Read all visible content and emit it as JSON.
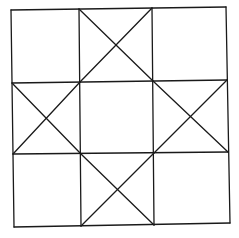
{
  "diagram": {
    "type": "quilt-block-grid",
    "rows": 3,
    "cols": 3,
    "line_color": "#1a1a1a",
    "background": "#ffffff",
    "cells": [
      {
        "row": 0,
        "col": 0,
        "crossed": false
      },
      {
        "row": 0,
        "col": 1,
        "crossed": true
      },
      {
        "row": 0,
        "col": 2,
        "crossed": false
      },
      {
        "row": 1,
        "col": 0,
        "crossed": true
      },
      {
        "row": 1,
        "col": 1,
        "crossed": false
      },
      {
        "row": 1,
        "col": 2,
        "crossed": true
      },
      {
        "row": 2,
        "col": 0,
        "crossed": false
      },
      {
        "row": 2,
        "col": 1,
        "crossed": true
      },
      {
        "row": 2,
        "col": 2,
        "crossed": false
      }
    ]
  }
}
